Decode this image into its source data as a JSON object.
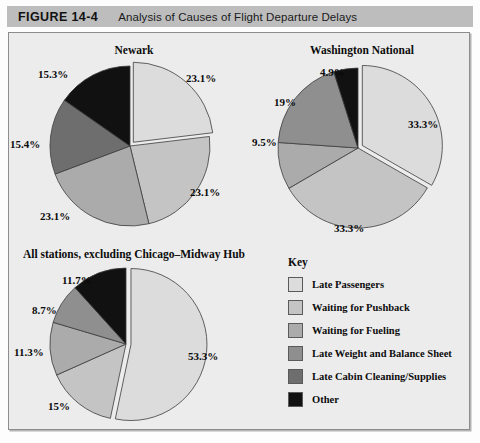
{
  "header": {
    "figure_number": "FIGURE 14-4",
    "caption": "Analysis of Causes of Flight Departure Delays"
  },
  "legend": {
    "title": "Key",
    "items": [
      {
        "label": "Late Passengers",
        "color": "#dcdcdc"
      },
      {
        "label": "Waiting for Pushback",
        "color": "#c4c4c4"
      },
      {
        "label": "Waiting for Fueling",
        "color": "#ababab"
      },
      {
        "label": "Late Weight and Balance Sheet",
        "color": "#8f8f8f"
      },
      {
        "label": "Late Cabin Cleaning/Supplies",
        "color": "#6e6e6e"
      },
      {
        "label": "Other",
        "color": "#111111"
      }
    ]
  },
  "chart_data": [
    {
      "type": "pie",
      "title": "Newark",
      "categories": [
        "Late Passengers",
        "Waiting for Pushback",
        "Waiting for Fueling",
        "Late Weight and Balance Sheet",
        "Late Cabin Cleaning/Supplies",
        "Other"
      ],
      "values": [
        23.1,
        23.1,
        23.1,
        0,
        15.4,
        15.3
      ],
      "labels": [
        "23.1%",
        "23.1%",
        "23.1%",
        "",
        "15.4%",
        "15.3%"
      ],
      "colors": [
        "#dcdcdc",
        "#c4c4c4",
        "#ababab",
        "#8f8f8f",
        "#6e6e6e",
        "#111111"
      ],
      "exploded_slice": 0,
      "units": "percent"
    },
    {
      "type": "pie",
      "title": "Washington National",
      "categories": [
        "Late Passengers",
        "Waiting for Pushback",
        "Waiting for Fueling",
        "Late Weight and Balance Sheet",
        "Other"
      ],
      "values": [
        33.3,
        33.3,
        9.5,
        19.0,
        4.9
      ],
      "labels": [
        "33.3%",
        "33.3%",
        "9.5%",
        "19%",
        "4.9%"
      ],
      "colors": [
        "#dcdcdc",
        "#c4c4c4",
        "#ababab",
        "#8f8f8f",
        "#111111"
      ],
      "exploded_slice": 0,
      "units": "percent"
    },
    {
      "type": "pie",
      "title": "All stations, excluding Chicago–Midway Hub",
      "categories": [
        "Late Passengers",
        "Waiting for Pushback",
        "Waiting for Fueling",
        "Late Weight and Balance Sheet",
        "Other"
      ],
      "values": [
        53.3,
        15.0,
        11.3,
        8.7,
        11.7
      ],
      "labels": [
        "53.3%",
        "15%",
        "11.3%",
        "8.7%",
        "11.7%"
      ],
      "colors": [
        "#dcdcdc",
        "#c4c4c4",
        "#ababab",
        "#8f8f8f",
        "#111111"
      ],
      "exploded_slice": 0,
      "units": "percent"
    }
  ],
  "charts": {
    "newark": {
      "title": "Newark",
      "pct": {
        "p0": "23.1%",
        "p1": "23.1%",
        "p2": "23.1%",
        "p4": "15.4%",
        "p5": "15.3%"
      }
    },
    "washington": {
      "title": "Washington National",
      "pct": {
        "p0": "33.3%",
        "p1": "33.3%",
        "p2": "9.5%",
        "p3": "19%",
        "p4": "4.9%"
      }
    },
    "allstations": {
      "title": "All stations, excluding Chicago–Midway Hub",
      "pct": {
        "p0": "53.3%",
        "p1": "15%",
        "p2": "11.3%",
        "p3": "8.7%",
        "p4": "11.7%"
      }
    }
  }
}
